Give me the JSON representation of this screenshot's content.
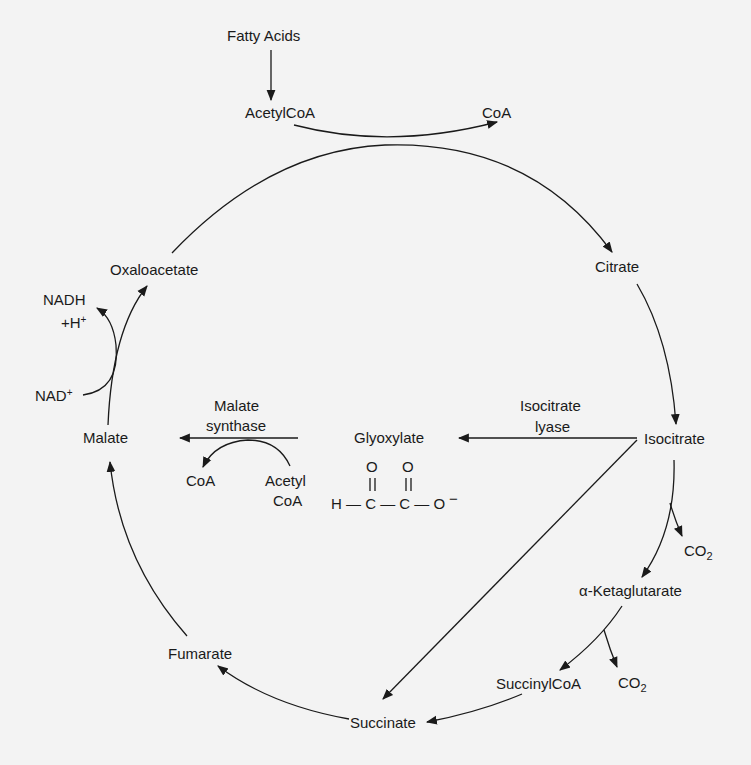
{
  "diagram": {
    "type": "metabolic-pathway",
    "background_color": "#f3f3f3",
    "ink_color": "#1a1a1a",
    "nodes": {
      "fatty_acids": "Fatty Acids",
      "acetyl_coa_top": "AcetylCoA",
      "coa_top": "CoA",
      "citrate": "Citrate",
      "isocitrate": "Isocitrate",
      "co2_1": "CO",
      "co2_1_sub": "2",
      "alpha_ketoglutarate": "α-Ketaglutarate",
      "co2_2": "CO",
      "co2_2_sub": "2",
      "succinyl_coa": "SuccinylCoA",
      "succinate": "Succinate",
      "fumarate": "Fumarate",
      "malate": "Malate",
      "oxaloacetate": "Oxaloacetate",
      "nadh_line1": "NADH",
      "nadh_line2": "+H",
      "nadh_sup": "+",
      "nad": "NAD",
      "nad_sup": "+",
      "glyoxylate": "Glyoxylate",
      "malate_synthase_coa": "CoA",
      "malate_synthase_acetyl_line1": "Acetyl",
      "malate_synthase_acetyl_line2": "CoA"
    },
    "enzymes": {
      "isocitrate_lyase_line1": "Isocitrate",
      "isocitrate_lyase_line2": "lyase",
      "malate_synthase_line1": "Malate",
      "malate_synthase_line2": "synthase"
    },
    "glyoxylate_structure": {
      "o1": "O",
      "o2": "O",
      "double_bond1": "||",
      "double_bond2": "||",
      "formula": "H — C — C — O",
      "charge": "−"
    },
    "edges": [
      {
        "from": "Fatty Acids",
        "to": "AcetylCoA"
      },
      {
        "from": "AcetylCoA",
        "to": "CoA"
      },
      {
        "from": "Oxaloacetate",
        "to": "Citrate"
      },
      {
        "from": "Citrate",
        "to": "Isocitrate"
      },
      {
        "from": "Isocitrate",
        "to": "α-Ketaglutarate",
        "side_product": "CO2"
      },
      {
        "from": "α-Ketaglutarate",
        "to": "SuccinylCoA",
        "side_product": "CO2"
      },
      {
        "from": "SuccinylCoA",
        "to": "Succinate"
      },
      {
        "from": "Succinate",
        "to": "Fumarate"
      },
      {
        "from": "Fumarate",
        "to": "Malate"
      },
      {
        "from": "Malate",
        "to": "Oxaloacetate",
        "cofactor_in": "NAD+",
        "cofactor_out": "NADH +H+"
      },
      {
        "from": "Isocitrate",
        "to": "Glyoxylate",
        "enzyme": "Isocitrate lyase"
      },
      {
        "from": "Isocitrate",
        "to": "Succinate",
        "enzyme": "Isocitrate lyase"
      },
      {
        "from": "Glyoxylate",
        "to": "Malate",
        "enzyme": "Malate synthase",
        "cofactor_in": "Acetyl CoA",
        "cofactor_out": "CoA"
      }
    ]
  }
}
